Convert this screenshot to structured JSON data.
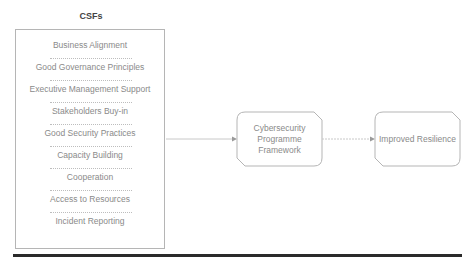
{
  "diagram": {
    "csf_title": "CSFs",
    "csfs": [
      "Business Alignment",
      "Good Governance Principles",
      "Executive Management Support",
      "Stakeholders Buy-in",
      "Good Security Practices",
      "Capacity Building",
      "Cooperation",
      "Access to Resources",
      "Incident Reporting"
    ],
    "framework_node": {
      "line1": "Cybersecurity",
      "line2": "Programme",
      "line3": "Framework"
    },
    "outcome_node": "Improved Resilience",
    "colors": {
      "stroke": "#b5b5b5",
      "text": "#8a8a8a",
      "rule": "#2a2a2a"
    }
  }
}
